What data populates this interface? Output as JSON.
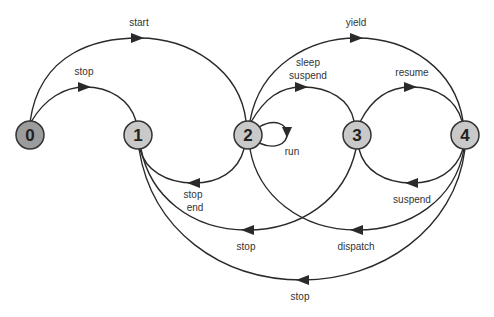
{
  "diagram": {
    "type": "state-transition",
    "colors": {
      "initial_node_fill": "#9c9c9c",
      "node_fill": "#c9c9c9",
      "stroke": "#2a2a2a"
    },
    "nodes": [
      {
        "id": "0",
        "label": "0"
      },
      {
        "id": "1",
        "label": "1"
      },
      {
        "id": "2",
        "label": "2"
      },
      {
        "id": "3",
        "label": "3"
      },
      {
        "id": "4",
        "label": "4"
      }
    ],
    "edges": [
      {
        "from": "0",
        "to": "2",
        "label": "start"
      },
      {
        "from": "0",
        "to": "1",
        "label": "stop"
      },
      {
        "from": "2",
        "to": "4",
        "label": "yield"
      },
      {
        "from": "2",
        "to": "3",
        "label_line1": "sleep",
        "label_line2": "suspend"
      },
      {
        "from": "3",
        "to": "4",
        "label": "resume"
      },
      {
        "from": "2",
        "to": "2",
        "label": "run"
      },
      {
        "from": "2",
        "to": "1",
        "label_line1": "stop",
        "label_line2": "end"
      },
      {
        "from": "4",
        "to": "3",
        "label": "suspend"
      },
      {
        "from": "3",
        "to": "1",
        "label": "stop"
      },
      {
        "from": "4",
        "to": "2",
        "label": "dispatch"
      },
      {
        "from": "4",
        "to": "1",
        "label": "stop"
      }
    ]
  }
}
